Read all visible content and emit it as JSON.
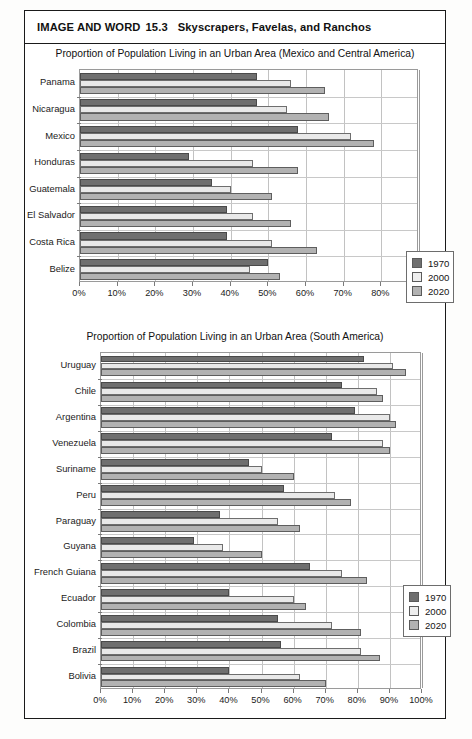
{
  "header": {
    "kicker": "IMAGE AND WORD",
    "number": "15.3",
    "subtitle": "Skyscrapers, Favelas, and Ranchos"
  },
  "legend": {
    "items": [
      {
        "label": "1970",
        "key": "s1970",
        "color": "#6f6f6f"
      },
      {
        "label": "2000",
        "key": "s2000",
        "color": "#eeeeee"
      },
      {
        "label": "2020",
        "key": "s2020",
        "color": "#b2b2b2"
      }
    ]
  },
  "chart_data": [
    {
      "id": "chart-central-america",
      "type": "bar",
      "orientation": "horizontal",
      "title": "Proportion of Population Living in an Urban Area (Mexico and Central America)",
      "xlabel": "",
      "ylabel": "",
      "xlim": [
        0,
        90
      ],
      "xticks": [
        0,
        10,
        20,
        30,
        40,
        50,
        60,
        70,
        80,
        90
      ],
      "xtick_labels": [
        "0%",
        "10%",
        "20%",
        "30%",
        "40%",
        "50%",
        "60%",
        "70%",
        "80%",
        "90%"
      ],
      "grid": true,
      "legend_position": "bottom-right",
      "categories": [
        "Panama",
        "Nicaragua",
        "Mexico",
        "Honduras",
        "Guatemala",
        "El Salvador",
        "Costa Rica",
        "Belize"
      ],
      "series": [
        {
          "name": "1970",
          "values": [
            47,
            47,
            58,
            29,
            35,
            39,
            39,
            50
          ]
        },
        {
          "name": "2000",
          "values": [
            56,
            55,
            72,
            46,
            40,
            46,
            51,
            45
          ]
        },
        {
          "name": "2020",
          "values": [
            65,
            66,
            78,
            58,
            51,
            56,
            63,
            53
          ]
        }
      ]
    },
    {
      "id": "chart-south-america",
      "type": "bar",
      "orientation": "horizontal",
      "title": "Proportion of Population Living in an Urban Area (South America)",
      "xlabel": "",
      "ylabel": "",
      "xlim": [
        0,
        100
      ],
      "xticks": [
        0,
        10,
        20,
        30,
        40,
        50,
        60,
        70,
        80,
        90,
        100
      ],
      "xtick_labels": [
        "0%",
        "10%",
        "20%",
        "30%",
        "40%",
        "50%",
        "60%",
        "70%",
        "80%",
        "90%",
        "100%"
      ],
      "grid": true,
      "legend_position": "bottom-right",
      "categories": [
        "Uruguay",
        "Chile",
        "Argentina",
        "Venezuela",
        "Suriname",
        "Peru",
        "Paraguay",
        "Guyana",
        "French Guiana",
        "Ecuador",
        "Colombia",
        "Brazil",
        "Bolivia"
      ],
      "series": [
        {
          "name": "1970",
          "values": [
            82,
            75,
            79,
            72,
            46,
            57,
            37,
            29,
            65,
            40,
            55,
            56,
            40
          ]
        },
        {
          "name": "2000",
          "values": [
            91,
            86,
            90,
            88,
            50,
            73,
            55,
            38,
            75,
            60,
            72,
            81,
            62
          ]
        },
        {
          "name": "2020",
          "values": [
            95,
            88,
            92,
            90,
            60,
            78,
            62,
            50,
            83,
            64,
            81,
            87,
            70
          ]
        }
      ]
    }
  ]
}
